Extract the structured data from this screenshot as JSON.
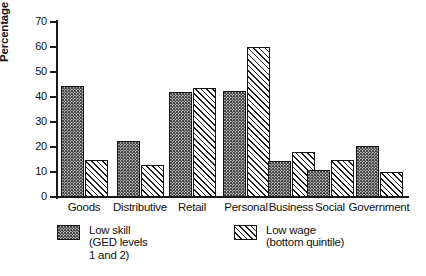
{
  "chart_data": {
    "type": "bar",
    "title": "",
    "xlabel": "",
    "ylabel": "Percentage",
    "ylim": [
      0,
      70
    ],
    "yticks": [
      0,
      10,
      20,
      30,
      40,
      50,
      60,
      70
    ],
    "grid": false,
    "legend_position": "bottom",
    "categories": [
      "Goods",
      "Distributive",
      "Retail",
      "Personal",
      "Business",
      "Social",
      "Government"
    ],
    "series": [
      {
        "name": "Low skill (GED levels 1 and 2)",
        "legend_line1": "Low skill",
        "legend_line2": "(GED levels",
        "legend_line3": "1 and 2)",
        "pattern": "dotted",
        "values": [
          44.5,
          22.5,
          42,
          42.5,
          14.5,
          11,
          20.5
        ]
      },
      {
        "name": "Low wage (bottom quintile)",
        "legend_line1": "Low wage",
        "legend_line2": "(bottom quintile)",
        "legend_line3": "",
        "pattern": "diagonal-hatch",
        "values": [
          15,
          13,
          43.5,
          60,
          18,
          15,
          10
        ]
      }
    ]
  },
  "colors": {
    "ink": "#151515",
    "series1_fill": "#b9b9b9",
    "series2_fill": "#ffffff",
    "background": "#ffffff"
  }
}
